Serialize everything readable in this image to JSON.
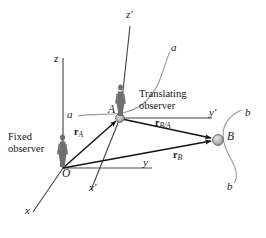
{
  "figure": {
    "type": "diagram",
    "background_color": "#ffffff",
    "line_color": "#3a3a3a",
    "vector_color": "#1a1a1a",
    "node_fill": "#b9b9b9",
    "node_stroke": "#4a4a4a",
    "curve_color": "#8c8c8c",
    "figure_color": "#6e6e6e"
  },
  "points": {
    "origin": {
      "label": "O",
      "x": 63,
      "y": 168
    },
    "a_point": {
      "label": "A",
      "x": 120,
      "y": 118
    },
    "b_point": {
      "label": "B",
      "x": 218,
      "y": 140
    }
  },
  "fixed_axes": {
    "z": {
      "label": "z",
      "tip_x": 63,
      "tip_y": 58,
      "label_x": 56,
      "label_y": 56
    },
    "y": {
      "label": "y",
      "tip_x": 152,
      "tip_y": 168,
      "label_x": 144,
      "label_y": 160
    },
    "x": {
      "label": "x",
      "tip_x": 33,
      "tip_y": 210,
      "label_x": 26,
      "label_y": 206
    }
  },
  "translating_axes": {
    "zp": {
      "label": "z′",
      "tip_x": 130,
      "tip_y": 28,
      "label_x": 127,
      "label_y": 11
    },
    "yp": {
      "label": "y′",
      "tip_x": 212,
      "tip_y": 118,
      "label_x": 207,
      "label_y": 110
    },
    "xp": {
      "label": "x′",
      "tip_x": 92,
      "tip_y": 188,
      "label_x": 90,
      "label_y": 184
    }
  },
  "vectors": [
    {
      "name": "r_A",
      "from": "O",
      "to": "A",
      "bold": "r",
      "sub": "A",
      "label_x": 74,
      "label_y": 129
    },
    {
      "name": "r_B",
      "from": "O",
      "to": "B",
      "bold": "r",
      "sub": "B",
      "label_x": 172,
      "label_y": 152
    },
    {
      "name": "r_B/A",
      "from": "A",
      "to": "B",
      "bold": "r",
      "sub": "B/A",
      "label_x": 157,
      "label_y": 121
    }
  ],
  "curves": [
    {
      "name": "path-a-upper",
      "label": "a",
      "label_x": 172,
      "label_y": 48
    },
    {
      "name": "path-a-lower",
      "label": "a",
      "label_x": 85,
      "label_y": 112
    },
    {
      "name": "path-b-upper",
      "label": "b",
      "label_x": 243,
      "label_y": 113
    },
    {
      "name": "path-b-lower",
      "label": "b",
      "label_x": 228,
      "label_y": 185
    }
  ],
  "annotations": {
    "fixed_observer": {
      "line1": "Fixed",
      "line2": "observer",
      "x": 8,
      "y": 133
    },
    "translating_observer": {
      "line1": "Translating",
      "line2": "observer",
      "x": 140,
      "y": 89
    }
  }
}
